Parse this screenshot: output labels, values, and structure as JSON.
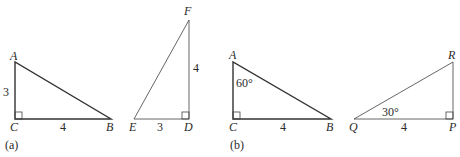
{
  "panels": [
    {
      "caption": "(a)",
      "triangles": [
        {
          "vertices": {
            "A": "A",
            "B": "B",
            "C": "C"
          },
          "sides": {
            "AC": "3",
            "CB": "4"
          },
          "right_angle_at": "C"
        },
        {
          "vertices": {
            "E": "E",
            "D": "D",
            "F": "F"
          },
          "sides": {
            "ED": "3",
            "DF": "4"
          },
          "right_angle_at": "D"
        }
      ]
    },
    {
      "caption": "(b)",
      "triangles": [
        {
          "vertices": {
            "A": "A",
            "B": "B",
            "C": "C"
          },
          "sides": {
            "CB": "4"
          },
          "angles": {
            "A": "60°"
          },
          "right_angle_at": "C"
        },
        {
          "vertices": {
            "Q": "Q",
            "P": "P",
            "R": "R"
          },
          "sides": {
            "QP": "4"
          },
          "angles": {
            "Q": "30°"
          },
          "right_angle_at": "P"
        }
      ]
    }
  ]
}
